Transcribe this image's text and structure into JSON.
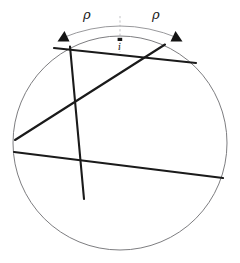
{
  "figure": {
    "labels": {
      "rho_left": "ρ",
      "rho_right": "ρ",
      "center_point": "i"
    },
    "colors": {
      "circle_stroke": "#6e6e72",
      "chord_stroke": "#1a1a1a",
      "arc_stroke": "#8c8c90",
      "arrow_fill": "#141414",
      "dash_stroke": "#b4b4b8",
      "background": "#ffffff",
      "text": "#1a1a1a"
    },
    "geometry": {
      "circle": {
        "cx": 120,
        "cy": 143,
        "r": 107
      },
      "arc": {
        "description": "thin measuring arc above circle spanning both rho segments",
        "left_end": {
          "x": 62,
          "y": 38
        },
        "apex": {
          "x": 120,
          "y": 22
        },
        "right_end": {
          "x": 178,
          "y": 38
        }
      },
      "arrowheads": [
        {
          "name": "arrow-left",
          "x": 63,
          "y": 36,
          "direction": "left"
        },
        {
          "name": "arrow-right",
          "x": 177,
          "y": 36,
          "direction": "right"
        }
      ],
      "center_marker": {
        "x": 120,
        "y": 40
      },
      "dashed_axis": {
        "x": 120,
        "y1": 16,
        "y2": 52
      },
      "chords": [
        {
          "name": "chord-top",
          "x1": 54,
          "y1": 48,
          "x2": 196,
          "y2": 63
        },
        {
          "name": "chord-steep-left",
          "x1": 70,
          "y1": 47,
          "x2": 84,
          "y2": 198
        },
        {
          "name": "chord-diagonal-rising",
          "x1": 15,
          "y1": 140,
          "x2": 164,
          "y2": 45
        },
        {
          "name": "chord-long-descending",
          "x1": 14,
          "y1": 152,
          "x2": 222,
          "y2": 178
        }
      ]
    },
    "label_positions": {
      "rho_left": {
        "x": 83,
        "y": 10
      },
      "rho_right": {
        "x": 152,
        "y": 10
      },
      "center_point": {
        "x": 117,
        "y": 44
      }
    }
  }
}
